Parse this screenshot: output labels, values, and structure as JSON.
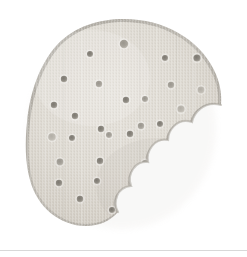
{
  "scene": {
    "title": "Round cracker with a bite taken out",
    "subject_name": "cracker",
    "background_label": "white background",
    "surface_label": "plain white surface",
    "image_width": 247,
    "image_height": 257
  },
  "colors": {
    "background": "#ffffff",
    "cracker_body_light": "#dedad2",
    "cracker_body_mid": "#d4cfc6",
    "cracker_body_shade": "#cac5bb",
    "cracker_rim": "#b4b0a8",
    "cracker_rim_dark": "#a19d95",
    "dock_hole_dark": "#8c8880",
    "dock_hole_mid": "#a8a49c",
    "dock_hole_light": "#bfbbb3",
    "bottom_rule": "#d8d8d8",
    "shadow_soft": "#efedea"
  },
  "cracker": {
    "label": "cracker-body",
    "outline_label": "cracker-outline",
    "bite_label": "bite-notch",
    "center_x": 124,
    "center_y": 123,
    "radius_x": 96,
    "radius_y": 104,
    "bite": {
      "center_x": 208,
      "center_y": 150,
      "radius": 56,
      "scallop_count": 5,
      "side": "right"
    },
    "texture": {
      "type": "speckled-grain",
      "vertical_streaks": true
    }
  },
  "dock_holes": {
    "label": "dock-holes",
    "count": 31,
    "points": [
      {
        "x": 124,
        "y": 44,
        "r": 4.2,
        "tone": "mid"
      },
      {
        "x": 90,
        "y": 54,
        "r": 3.0,
        "tone": "dark"
      },
      {
        "x": 165,
        "y": 58,
        "r": 3.0,
        "tone": "dark"
      },
      {
        "x": 197,
        "y": 58,
        "r": 3.6,
        "tone": "dark"
      },
      {
        "x": 64,
        "y": 79,
        "r": 3.2,
        "tone": "dark"
      },
      {
        "x": 99,
        "y": 84,
        "r": 3.2,
        "tone": "mid"
      },
      {
        "x": 171,
        "y": 85,
        "r": 3.2,
        "tone": "mid"
      },
      {
        "x": 145,
        "y": 99,
        "r": 3.0,
        "tone": "mid"
      },
      {
        "x": 201,
        "y": 90,
        "r": 3.4,
        "tone": "light"
      },
      {
        "x": 126,
        "y": 100,
        "r": 3.2,
        "tone": "dark"
      },
      {
        "x": 54,
        "y": 105,
        "r": 3.2,
        "tone": "dark"
      },
      {
        "x": 181,
        "y": 109,
        "r": 3.6,
        "tone": "light"
      },
      {
        "x": 75,
        "y": 116,
        "r": 3.2,
        "tone": "dark"
      },
      {
        "x": 160,
        "y": 124,
        "r": 3.0,
        "tone": "dark"
      },
      {
        "x": 101,
        "y": 129,
        "r": 3.2,
        "tone": "dark"
      },
      {
        "x": 141,
        "y": 126,
        "r": 3.2,
        "tone": "mid"
      },
      {
        "x": 52,
        "y": 137,
        "r": 3.8,
        "tone": "light"
      },
      {
        "x": 72,
        "y": 138,
        "r": 3.0,
        "tone": "dark"
      },
      {
        "x": 130,
        "y": 134,
        "r": 3.2,
        "tone": "dark"
      },
      {
        "x": 109,
        "y": 135,
        "r": 3.0,
        "tone": "mid"
      },
      {
        "x": 169,
        "y": 153,
        "r": 3.2,
        "tone": "dark"
      },
      {
        "x": 60,
        "y": 162,
        "r": 3.4,
        "tone": "mid"
      },
      {
        "x": 100,
        "y": 161,
        "r": 3.2,
        "tone": "dark"
      },
      {
        "x": 145,
        "y": 163,
        "r": 3.0,
        "tone": "mid"
      },
      {
        "x": 59,
        "y": 183,
        "r": 3.2,
        "tone": "dark"
      },
      {
        "x": 97,
        "y": 181,
        "r": 3.0,
        "tone": "dark"
      },
      {
        "x": 133,
        "y": 180,
        "r": 3.0,
        "tone": "mid"
      },
      {
        "x": 80,
        "y": 199,
        "r": 3.2,
        "tone": "dark"
      },
      {
        "x": 129,
        "y": 198,
        "r": 3.0,
        "tone": "mid"
      },
      {
        "x": 112,
        "y": 210,
        "r": 3.0,
        "tone": "dark"
      },
      {
        "x": 155,
        "y": 190,
        "r": 3.0,
        "tone": "mid"
      }
    ]
  },
  "bottom_rule": {
    "label": "bottom-divider",
    "y": 250
  }
}
